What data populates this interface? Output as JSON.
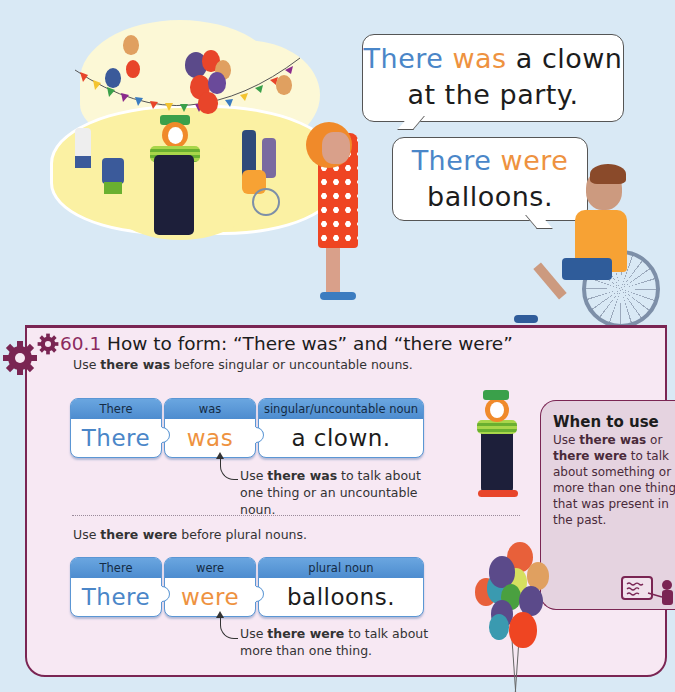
{
  "illustration": {
    "scene": "party-scene-with-clown-balloons-bunting-children",
    "speech_bubbles": [
      {
        "part1": "There",
        "part2": "was",
        "part3": "a clown",
        "line2": "at the party."
      },
      {
        "part1": "There",
        "part2": "were",
        "line2": "balloons."
      }
    ]
  },
  "section": {
    "number": "60.1",
    "title": "How to form: “There was” and “there were”",
    "intro_singular": {
      "prefix": "Use ",
      "bold": "there was",
      "suffix": " before singular or uncountable nouns."
    },
    "intro_plural": {
      "prefix": "Use ",
      "bold": "there were",
      "suffix": " before plural nouns."
    }
  },
  "puzzle_rows": [
    {
      "pieces": [
        {
          "header": "There",
          "word": "There",
          "color": "#4a86c8"
        },
        {
          "header": "was",
          "word": "was",
          "color": "#ee9240"
        },
        {
          "header": "singular/uncountable noun",
          "word": "a clown.",
          "color": "#1c1c1c"
        }
      ],
      "note": {
        "prefix": "Use ",
        "bold": "there was",
        "suffix": " to talk about one thing or an uncountable noun."
      }
    },
    {
      "pieces": [
        {
          "header": "There",
          "word": "There",
          "color": "#4a86c8"
        },
        {
          "header": "were",
          "word": "were",
          "color": "#ee9240"
        },
        {
          "header": "plural noun",
          "word": "balloons.",
          "color": "#1c1c1c"
        }
      ],
      "note": {
        "prefix": "Use ",
        "bold": "there were",
        "suffix": " to talk about more than one thing."
      }
    }
  ],
  "when_to_use": {
    "title": "When to use",
    "body_prefix": "Use ",
    "bold1": "there was",
    "middle": " or ",
    "bold2": "there were",
    "body_suffix": " to talk about something or more than one thing that was present in the past."
  },
  "colors": {
    "accent_purple": "#7a2553",
    "subject_blue": "#4a86c8",
    "verb_orange": "#ee9240",
    "panel_bg": "#f7e8f3",
    "page_bg": "#d9e9f5"
  }
}
